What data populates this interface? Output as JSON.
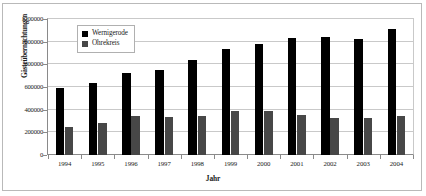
{
  "chart_data": {
    "type": "bar",
    "title": "",
    "xlabel": "Jahr",
    "ylabel": "Gästeübernachtungen",
    "categories": [
      "1994",
      "1995",
      "1996",
      "1997",
      "1998",
      "1999",
      "2000",
      "2001",
      "2002",
      "2003",
      "2004"
    ],
    "ylim": [
      0,
      1200000
    ],
    "ytick_labels": [
      "0",
      "200000",
      "400000",
      "600000",
      "800000",
      "1000000",
      "1200000"
    ],
    "ytick_values": [
      0,
      200000,
      400000,
      600000,
      800000,
      1000000,
      1200000
    ],
    "grid": true,
    "legend_position": "upper-left-inside",
    "series": [
      {
        "name": "Wernigerode",
        "color": "#000000",
        "values": [
          595000,
          635000,
          720000,
          750000,
          835000,
          935000,
          980000,
          1030000,
          1040000,
          1025000,
          1115000
        ]
      },
      {
        "name": "Ohrekreis",
        "color": "#474747",
        "values": [
          250000,
          285000,
          340000,
          335000,
          340000,
          390000,
          385000,
          350000,
          330000,
          325000,
          340000
        ]
      }
    ]
  },
  "legend": {
    "items": [
      {
        "label": "Wernigerode",
        "color": "#000000"
      },
      {
        "label": "Ohrekreis",
        "color": "#474747"
      }
    ]
  }
}
